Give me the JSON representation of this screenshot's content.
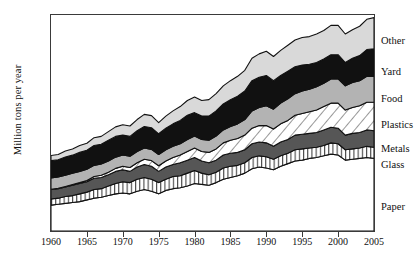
{
  "chart_data": {
    "type": "area",
    "stacked": true,
    "title": "",
    "xlabel": "",
    "ylabel": "Million tons per year",
    "xlim": [
      1960,
      2005
    ],
    "ylim": [
      0,
      250
    ],
    "grid": false,
    "legend_position": "right-outside",
    "x_ticks": [
      1960,
      1965,
      1970,
      1975,
      1980,
      1985,
      1990,
      1995,
      2000,
      2005
    ],
    "y_ticks": [
      0,
      50,
      100,
      150,
      200,
      250
    ],
    "x": [
      1960,
      1961,
      1962,
      1963,
      1964,
      1965,
      1966,
      1967,
      1968,
      1969,
      1970,
      1971,
      1972,
      1973,
      1974,
      1975,
      1976,
      1977,
      1978,
      1979,
      1980,
      1981,
      1982,
      1983,
      1984,
      1985,
      1986,
      1987,
      1988,
      1989,
      1990,
      1991,
      1992,
      1993,
      1994,
      1995,
      1996,
      1997,
      1998,
      1999,
      2000,
      2001,
      2002,
      2003,
      2004,
      2005
    ],
    "series": [
      {
        "name": "Paper",
        "fill": "#ffffff",
        "pattern": "solid-white",
        "values": [
          30,
          31,
          32,
          33,
          34,
          36,
          38,
          39,
          41,
          43,
          44,
          43,
          46,
          48,
          46,
          43,
          47,
          49,
          50,
          52,
          55,
          54,
          53,
          56,
          60,
          62,
          64,
          67,
          72,
          74,
          73,
          71,
          75,
          78,
          81,
          82,
          84,
          85,
          87,
          89,
          88,
          82,
          83,
          84,
          85,
          84
        ]
      },
      {
        "name": "Glass",
        "fill": "#ffffff",
        "pattern": "vertical-stripes",
        "values": [
          7,
          7,
          8,
          8,
          9,
          9,
          10,
          10,
          11,
          12,
          13,
          13,
          14,
          14,
          14,
          13,
          13,
          14,
          14,
          15,
          15,
          13,
          12,
          12,
          13,
          13,
          12,
          12,
          13,
          13,
          13,
          12,
          12,
          12,
          13,
          13,
          12,
          12,
          12,
          13,
          13,
          12,
          12,
          12,
          13,
          13
        ]
      },
      {
        "name": "Metals",
        "fill": "#565656",
        "pattern": "solid-dark-gray",
        "values": [
          11,
          11,
          11,
          12,
          12,
          12,
          13,
          13,
          13,
          14,
          14,
          13,
          14,
          15,
          15,
          13,
          14,
          14,
          15,
          15,
          15,
          14,
          14,
          14,
          15,
          15,
          15,
          15,
          16,
          16,
          16,
          15,
          16,
          16,
          17,
          17,
          17,
          17,
          18,
          18,
          18,
          17,
          18,
          18,
          19,
          19
        ]
      },
      {
        "name": "Plastics",
        "fill": "#ffffff",
        "pattern": "diagonal-hatch",
        "values": [
          0.4,
          0.5,
          0.6,
          0.8,
          1,
          1.5,
          2,
          2.5,
          3,
          3.5,
          4,
          4.5,
          5,
          6,
          6.5,
          6.5,
          7,
          8,
          9,
          10,
          11,
          11,
          12,
          13,
          14,
          15,
          16,
          17,
          18,
          19,
          20,
          20,
          21,
          22,
          23,
          24,
          25,
          26,
          27,
          28,
          29,
          29,
          30,
          31,
          32,
          33
        ]
      },
      {
        "name": "Food",
        "fill": "#b3b3b3",
        "pattern": "solid-medium-gray",
        "values": [
          13,
          13,
          13,
          13,
          13,
          13,
          13,
          13,
          13,
          13,
          13,
          13,
          13,
          13,
          13,
          13,
          13,
          13,
          13,
          14,
          14,
          14,
          14,
          15,
          15,
          16,
          17,
          18,
          20,
          21,
          23,
          23,
          24,
          25,
          25,
          26,
          26,
          27,
          27,
          28,
          28,
          28,
          29,
          29,
          30,
          30
        ]
      },
      {
        "name": "Yard",
        "fill": "#111111",
        "pattern": "solid-black",
        "values": [
          20,
          20,
          21,
          21,
          22,
          22,
          23,
          23,
          24,
          24,
          23,
          23,
          24,
          25,
          25,
          24,
          25,
          26,
          27,
          28,
          27,
          27,
          28,
          29,
          30,
          31,
          32,
          33,
          35,
          35,
          35,
          33,
          32,
          32,
          31,
          30,
          29,
          28,
          28,
          28,
          28,
          27,
          28,
          29,
          31,
          32
        ]
      },
      {
        "name": "Other",
        "fill": "#d9d9d9",
        "pattern": "solid-light-gray",
        "values": [
          6,
          6,
          7,
          7,
          8,
          8,
          9,
          9,
          10,
          11,
          12,
          12,
          13,
          14,
          14,
          13,
          14,
          15,
          16,
          17,
          18,
          18,
          19,
          20,
          21,
          22,
          23,
          24,
          26,
          27,
          28,
          28,
          29,
          30,
          31,
          32,
          32,
          33,
          33,
          34,
          34,
          33,
          33,
          34,
          35,
          36
        ]
      }
    ],
    "legend_entries": [
      {
        "label": "Other",
        "y": 42
      },
      {
        "label": "Yard",
        "y": 73
      },
      {
        "label": "Food",
        "y": 100
      },
      {
        "label": "Plastics",
        "y": 126
      },
      {
        "label": "Metals",
        "y": 150
      },
      {
        "label": "Glass",
        "y": 166
      },
      {
        "label": "Paper",
        "y": 208
      }
    ]
  }
}
